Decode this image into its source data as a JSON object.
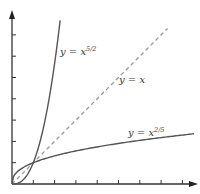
{
  "chart_data": {
    "type": "line",
    "title": "",
    "xlabel": "",
    "ylabel": "",
    "grid": false,
    "legend": "none (inline curve labels)",
    "xlim": [
      0,
      8.8
    ],
    "ylim": [
      0,
      8
    ],
    "x_ticks": [
      1,
      2,
      3,
      4,
      5,
      6,
      7,
      8
    ],
    "y_ticks": [
      1,
      2,
      3,
      4,
      5,
      6,
      7
    ],
    "tick_labels_shown": false,
    "series": [
      {
        "name": "y = x^(5/2)",
        "label_main": "y = x",
        "label_exp": "5/2",
        "style": "solid",
        "color": "#555555",
        "exponent": 2.5,
        "x_range": [
          0,
          2.26
        ]
      },
      {
        "name": "y = x",
        "label_main": "y = x",
        "label_exp": "",
        "style": "dashed",
        "color": "#9a9a9a",
        "exponent": 1,
        "x_range": [
          0,
          7.3
        ]
      },
      {
        "name": "y = x^(2/5)",
        "label_main": "y = x",
        "label_exp": "2/5",
        "style": "solid",
        "color": "#555555",
        "exponent": 0.4,
        "x_range": [
          0,
          8.55
        ]
      }
    ],
    "annotations": [
      "curves intersect at (0,0) and (1,1)"
    ]
  },
  "labels": {
    "steep": {
      "main": "y = x",
      "exp": "5/2"
    },
    "diag": {
      "main": "y = x",
      "exp": ""
    },
    "shallow": {
      "main": "y = x",
      "exp": "2/5"
    }
  }
}
